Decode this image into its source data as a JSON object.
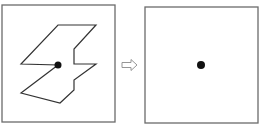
{
  "diagram": {
    "colors": {
      "background": "#ffffff",
      "frame": "#6b6b6b",
      "shape_stroke": "#333333",
      "dot": "#111111",
      "arrow": "#8a8a8a"
    },
    "left_panel": {
      "frame": {
        "x": 2,
        "y": 5,
        "w": 113,
        "h": 117
      },
      "polygon_points": "58,25 96,25 74,49 74,64 96,64 74,80 74,90 60,103 21,93 58,65 21,64",
      "dot": {
        "cx": 58,
        "cy": 65,
        "r": 3.5
      }
    },
    "arrow": {
      "type": "hollow-right-arrow",
      "points": "122,62.5 131,62.5 131,59.5 137,65 131,70.5 131,67.5 122,67.5"
    },
    "right_panel": {
      "frame": {
        "x": 145,
        "y": 7,
        "w": 113,
        "h": 116
      },
      "dot": {
        "cx": 201,
        "cy": 65,
        "r": 4
      }
    }
  }
}
